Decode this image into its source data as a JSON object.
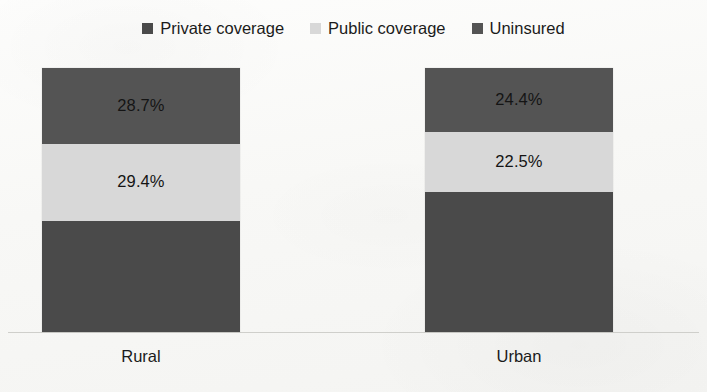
{
  "chart_data": {
    "type": "bar",
    "subtype": "stacked-100-percent",
    "title": "",
    "subtitle": "",
    "xlabel": "",
    "ylabel": "",
    "categories": [
      "Rural",
      "Urban"
    ],
    "ylim": [
      0,
      100
    ],
    "grid": false,
    "legend_position": "top-center",
    "stack_order_bottom_to_top": [
      "Private coverage",
      "Public coverage",
      "Uninsured"
    ],
    "series": [
      {
        "name": "Private coverage",
        "color": "#4a4a4a",
        "values": [
          41.9,
          53.1
        ],
        "labels": [
          "",
          ""
        ],
        "labels_visible": false
      },
      {
        "name": "Public coverage",
        "color": "#d8d8d8",
        "values": [
          29.4,
          22.5
        ],
        "labels": [
          "29.4%",
          "22.5%"
        ],
        "labels_visible": true
      },
      {
        "name": "Uninsured",
        "color": "#545454",
        "values": [
          28.7,
          24.4
        ],
        "labels": [
          "28.7%",
          "24.4%"
        ],
        "labels_visible": true
      }
    ]
  },
  "legend": {
    "items": [
      {
        "label": "Private coverage",
        "color": "#4a4a4a",
        "swatch_name": "legend-swatch-private"
      },
      {
        "label": "Public coverage",
        "color": "#d8d8d8",
        "swatch_name": "legend-swatch-public"
      },
      {
        "label": "Uninsured",
        "color": "#545454",
        "swatch_name": "legend-swatch-uninsured"
      }
    ]
  },
  "axis": {
    "categories": [
      "Rural",
      "Urban"
    ],
    "baseline_color": "#cfcfcb"
  },
  "bars": {
    "rural": {
      "category": "Rural",
      "segments": [
        {
          "series": "Uninsured",
          "value": 28.7,
          "label": "28.7%",
          "color": "#545454"
        },
        {
          "series": "Public coverage",
          "value": 29.4,
          "label": "29.4%",
          "color": "#d8d8d8"
        },
        {
          "series": "Private coverage",
          "value": 41.9,
          "label": "",
          "color": "#4a4a4a"
        }
      ]
    },
    "urban": {
      "category": "Urban",
      "segments": [
        {
          "series": "Uninsured",
          "value": 24.4,
          "label": "24.4%",
          "color": "#545454"
        },
        {
          "series": "Public coverage",
          "value": 22.5,
          "label": "22.5%",
          "color": "#d8d8d8"
        },
        {
          "series": "Private coverage",
          "value": 53.1,
          "label": "",
          "color": "#4a4a4a"
        }
      ]
    }
  },
  "colors": {
    "private": "#4a4a4a",
    "public": "#d8d8d8",
    "uninsured": "#545454",
    "background": "#fbfbfa",
    "text": "#1b1b1b"
  }
}
